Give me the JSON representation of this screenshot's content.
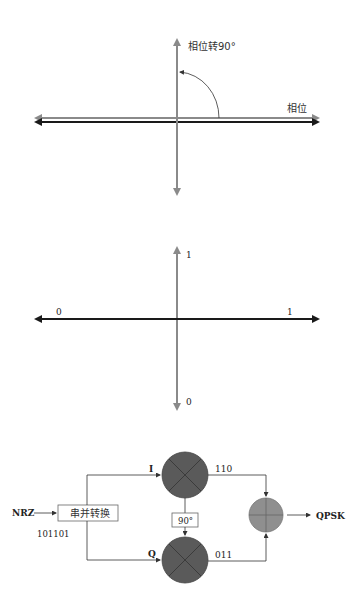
{
  "phase_diagram": {
    "vertical_label": "相位转90°",
    "horizontal_label": "相位",
    "colors": {
      "reference_axis": "#8a8a8a",
      "carrier_axis": "#1a1a1a",
      "arc": "#333333"
    }
  },
  "constellation_diagram": {
    "y_top_label": "1",
    "y_bottom_label": "0",
    "x_left_label": "0",
    "x_right_label": "1",
    "colors": {
      "vertical_axis": "#8a8a8a",
      "horizontal_axis": "#1a1a1a"
    }
  },
  "modulator_diagram": {
    "input_label": "NRZ",
    "input_bits": "101101",
    "sp_converter_label": "串并转换",
    "i_branch_label": "I",
    "q_branch_label": "Q",
    "phase_shifter_label": "90°",
    "i_output_bits": "110",
    "q_output_bits": "011",
    "output_label": "QPSK",
    "colors": {
      "mixer_fill": "#5a5a5a",
      "adder_fill": "#8f8f8f",
      "line": "#333333"
    }
  }
}
